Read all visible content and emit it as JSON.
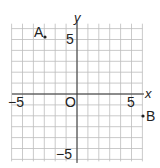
{
  "chart_data": {
    "type": "scatter",
    "title": "",
    "xlabel": "x",
    "ylabel": "y",
    "xlim": [
      -6,
      6
    ],
    "ylim": [
      -6,
      7
    ],
    "grid": true,
    "tick_labels": {
      "x": [
        {
          "value": -5,
          "label": "−5"
        },
        {
          "value": 5,
          "label": "5"
        }
      ],
      "y": [
        {
          "value": 5,
          "label": "5"
        },
        {
          "value": -5,
          "label": "−5"
        }
      ],
      "origin": "O"
    },
    "points": [
      {
        "name": "A",
        "x": -3,
        "y": 6
      },
      {
        "name": "B",
        "x": 6,
        "y": -2
      }
    ]
  },
  "labels": {
    "x_axis": "x",
    "y_axis": "y",
    "origin": "O",
    "x_neg5": "−5",
    "x_pos5": "5",
    "y_pos5": "5",
    "y_neg5": "−5",
    "point_a": "A",
    "point_b": "B"
  }
}
